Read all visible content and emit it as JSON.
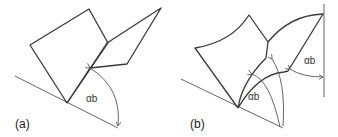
{
  "figure": {
    "panels": [
      {
        "id": "a",
        "caption": "(a)",
        "angle_label": "αb",
        "description": "Two flat plates folded along a common edge resting on an inclined base line; angle αb marked between base line and the right plate"
      },
      {
        "id": "b",
        "caption": "(b)",
        "angle_labels": [
          "αb",
          "αb"
        ],
        "description": "Two curved plates folded along a curved edge resting on an inclined base line, with vertical reference line; angle αb marked at two locations"
      }
    ],
    "colors": {
      "stroke": "#3a3a3a",
      "background": "#ffffff"
    }
  }
}
